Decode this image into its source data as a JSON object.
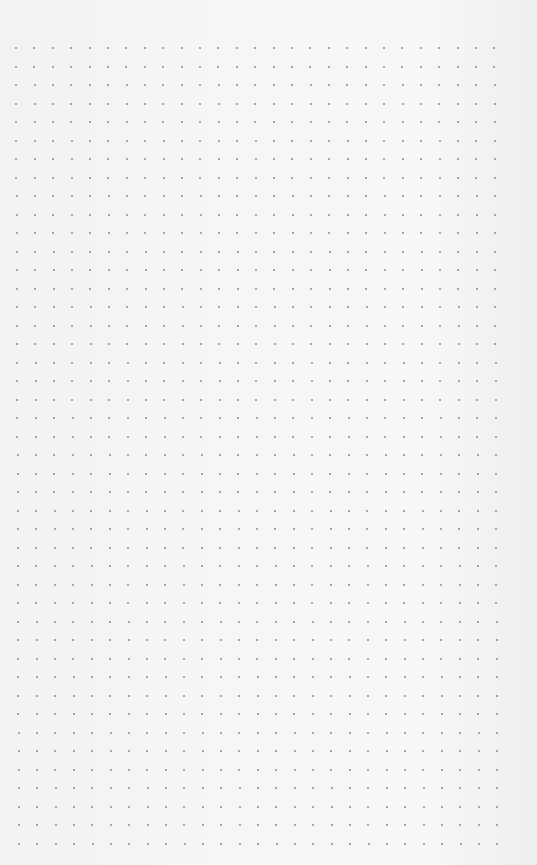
{
  "image": {
    "description": "Dotted grid paper",
    "background_color": "#f4f4f4",
    "dot_color": "#8a8a8a"
  },
  "grid": {
    "columns": 27,
    "rows": 44,
    "origin_x": 16,
    "origin_y": 48,
    "spacing_x": 18.4,
    "spacing_y": 18.5,
    "dot_size": 2
  }
}
